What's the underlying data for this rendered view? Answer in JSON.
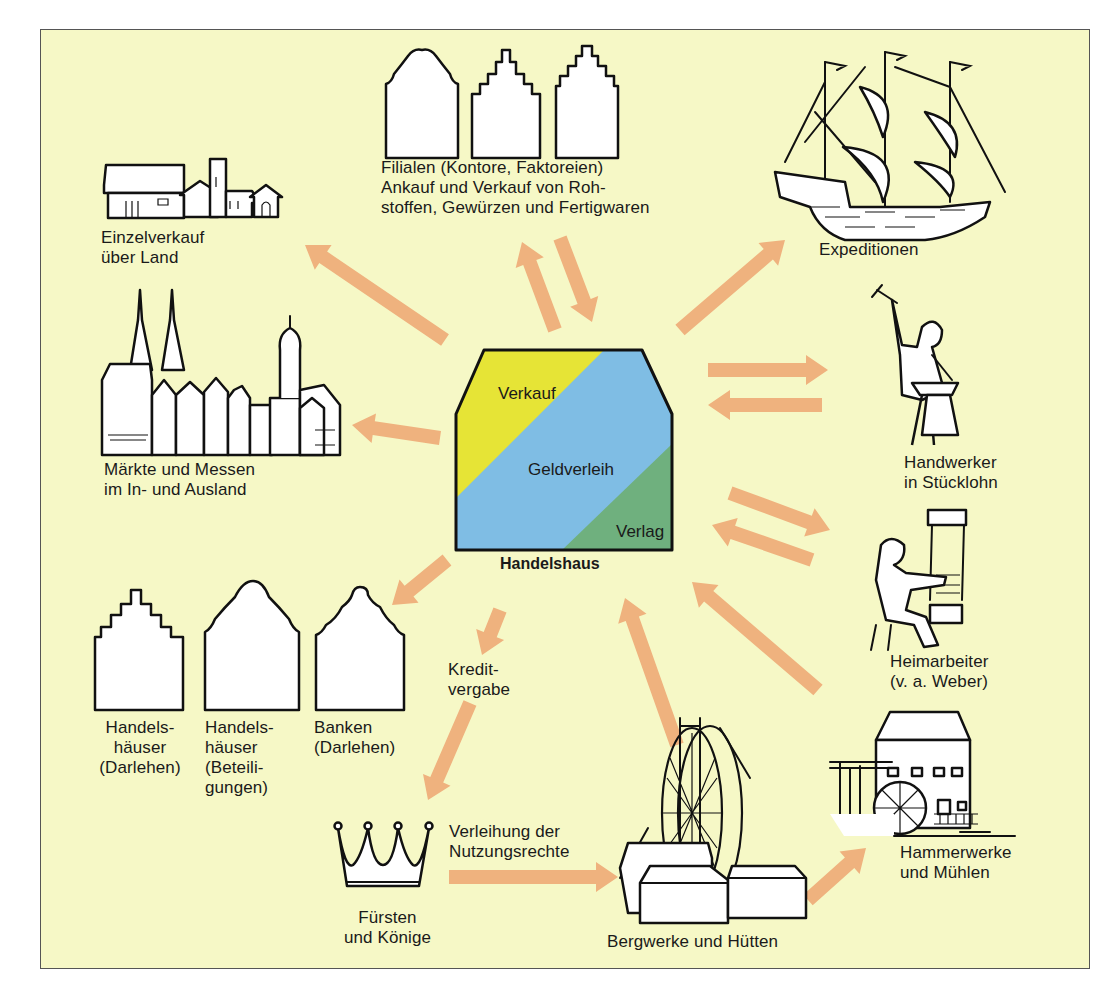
{
  "diagram": {
    "background_color": "#f6f8c6",
    "arrow_color": "#efb27e",
    "center": {
      "title": "Handelshaus",
      "segments": [
        {
          "label": "Verkauf",
          "color": "#e6e436"
        },
        {
          "label": "Geldverleih",
          "color": "#7fbde4"
        },
        {
          "label": "Verlag",
          "color": "#6fb07e"
        }
      ]
    },
    "nodes": {
      "filialen": {
        "label": "Filialen (Kontore, Faktoreien)\nAnkauf und Verkauf von Roh-\nstoffen, Gewürzen und Fertigwaren",
        "icon": "gabled-houses-icon"
      },
      "einzelverkauf": {
        "label": "Einzelverkauf\nüber Land",
        "icon": "village-icon"
      },
      "expeditionen": {
        "label": "Expeditionen",
        "icon": "sailing-ship-icon"
      },
      "maerkte": {
        "label": "Märkte und Messen\nim In- und Ausland",
        "icon": "town-cathedral-icon"
      },
      "handwerker": {
        "label": "Handwerker\nin Stücklohn",
        "icon": "blacksmith-icon"
      },
      "heimarbeiter": {
        "label": "Heimarbeiter\n(v. a. Weber)",
        "icon": "weaver-icon"
      },
      "handelshaeuser_darlehen": {
        "label": "Handels-\nhäuser\n(Darlehen)",
        "icon": "stepped-gable-house-icon"
      },
      "handelshaeuser_beteiligungen": {
        "label": "Handels-\nhäuser\n(Beteili-\ngungen)",
        "icon": "curved-gable-house-icon"
      },
      "banken": {
        "label": "Banken\n(Darlehen)",
        "icon": "bank-gable-house-icon"
      },
      "kreditvergabe": {
        "label": "Kredit-\nvergabe"
      },
      "fuersten": {
        "label": "Fürsten\nund Könige",
        "icon": "crown-icon"
      },
      "verleihung": {
        "label": "Verleihung der\nNutzungsrechte"
      },
      "bergwerke": {
        "label": "Bergwerke und Hütten",
        "icon": "mine-waterwheel-icon"
      },
      "hammerwerke": {
        "label": "Hammerwerke\nund Mühlen",
        "icon": "watermill-icon"
      }
    },
    "arrows": [
      {
        "name": "arrow-to-einzelverkauf",
        "from": [
          445,
          340
        ],
        "to": [
          305,
          245
        ]
      },
      {
        "name": "arrow-to-filialen",
        "from": [
          555,
          330
        ],
        "to": [
          522,
          242
        ]
      },
      {
        "name": "arrow-from-filialen",
        "from": [
          560,
          238
        ],
        "to": [
          592,
          322
        ]
      },
      {
        "name": "arrow-to-expeditionen",
        "from": [
          680,
          330
        ],
        "to": [
          785,
          240
        ]
      },
      {
        "name": "arrow-to-maerkte",
        "from": [
          440,
          438
        ],
        "to": [
          352,
          425
        ]
      },
      {
        "name": "arrow-to-handwerker",
        "from": [
          708,
          370
        ],
        "to": [
          828,
          370
        ]
      },
      {
        "name": "arrow-from-handwerker",
        "from": [
          822,
          405
        ],
        "to": [
          708,
          405
        ]
      },
      {
        "name": "arrow-to-heimarbeiter",
        "from": [
          730,
          493
        ],
        "to": [
          830,
          530
        ]
      },
      {
        "name": "arrow-from-heimarbeiter",
        "from": [
          812,
          560
        ],
        "to": [
          712,
          525
        ]
      },
      {
        "name": "arrow-from-hammerwerke",
        "from": [
          818,
          690
        ],
        "to": [
          692,
          582
        ]
      },
      {
        "name": "arrow-to-banken",
        "from": [
          447,
          560
        ],
        "to": [
          392,
          605
        ]
      },
      {
        "name": "arrow-kredit-upper",
        "from": [
          500,
          610
        ],
        "to": [
          482,
          655
        ]
      },
      {
        "name": "arrow-to-fuersten",
        "from": [
          470,
          703
        ],
        "to": [
          428,
          800
        ]
      },
      {
        "name": "arrow-from-bergwerke",
        "from": [
          677,
          745
        ],
        "to": [
          625,
          598
        ]
      },
      {
        "name": "arrow-to-bergwerke",
        "from": [
          449,
          877
        ],
        "to": [
          618,
          877
        ]
      },
      {
        "name": "arrow-to-hammerwerke",
        "from": [
          808,
          900
        ],
        "to": [
          866,
          848
        ]
      }
    ]
  }
}
